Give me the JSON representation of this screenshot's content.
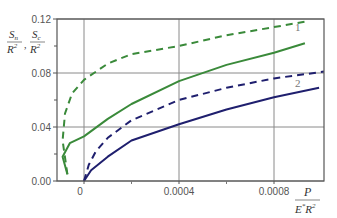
{
  "chart_data": {
    "type": "line",
    "title": "",
    "xlabel": "P / (E* R^2)",
    "ylabel": "S_n / R^2, S_c / R^2",
    "xlim": [
      -0.00012,
      0.00101
    ],
    "ylim": [
      0.0,
      0.12
    ],
    "x_ticks": [
      {
        "value": 0,
        "label": "0"
      },
      {
        "value": 0.0004,
        "label": "0.0004"
      },
      {
        "value": 0.0008,
        "label": "0.0008"
      }
    ],
    "y_ticks": [
      {
        "value": 0.0,
        "label": "0.00"
      },
      {
        "value": 0.04,
        "label": "0.04"
      },
      {
        "value": 0.08,
        "label": "0.08"
      },
      {
        "value": 0.12,
        "label": "0.12"
      }
    ],
    "y_minor_ticks": [
      0.02,
      0.06,
      0.1
    ],
    "x_minor_ticks": [
      0.0002,
      0.0006
    ],
    "grid": true,
    "legend": "none",
    "annotations": [
      {
        "text": "1",
        "x": 0.0009,
        "y": 0.111
      },
      {
        "text": "2",
        "x": 0.0009,
        "y": 0.07
      }
    ],
    "series": [
      {
        "name": "curve 1 (dashed)",
        "group": "1",
        "color": "#3a8a3a",
        "style": "dashed",
        "points": [
          [
            -7e-05,
            0.005
          ],
          [
            -9e-05,
            0.03
          ],
          [
            -8e-05,
            0.05
          ],
          [
            -5e-05,
            0.065
          ],
          [
            0,
            0.075
          ],
          [
            0.0001,
            0.087
          ],
          [
            0.0002,
            0.094
          ],
          [
            0.0004,
            0.1
          ],
          [
            0.0006,
            0.108
          ],
          [
            0.0008,
            0.114
          ],
          [
            0.00093,
            0.118
          ]
        ]
      },
      {
        "name": "curve 1 (solid)",
        "group": "1",
        "color": "#3a8a3a",
        "style": "solid",
        "points": [
          [
            -7e-05,
            0.005
          ],
          [
            -9e-05,
            0.018
          ],
          [
            -6e-05,
            0.028
          ],
          [
            0,
            0.033
          ],
          [
            0.0001,
            0.046
          ],
          [
            0.0002,
            0.057
          ],
          [
            0.0004,
            0.074
          ],
          [
            0.0006,
            0.086
          ],
          [
            0.0008,
            0.095
          ],
          [
            0.00093,
            0.102
          ]
        ]
      },
      {
        "name": "curve 2 (dashed)",
        "group": "2",
        "color": "#1f1f6e",
        "style": "dashed",
        "points": [
          [
            0,
            0
          ],
          [
            2e-05,
            0.012
          ],
          [
            5e-05,
            0.022
          ],
          [
            0.0001,
            0.032
          ],
          [
            0.0002,
            0.045
          ],
          [
            0.0004,
            0.06
          ],
          [
            0.0006,
            0.069
          ],
          [
            0.0008,
            0.076
          ],
          [
            0.00101,
            0.081
          ]
        ]
      },
      {
        "name": "curve 2 (solid)",
        "group": "2",
        "color": "#1f1f6e",
        "style": "solid",
        "points": [
          [
            0,
            0
          ],
          [
            3e-05,
            0.008
          ],
          [
            0.0001,
            0.018
          ],
          [
            0.0002,
            0.03
          ],
          [
            0.0004,
            0.042
          ],
          [
            0.0006,
            0.053
          ],
          [
            0.0008,
            0.062
          ],
          [
            0.00099,
            0.069
          ]
        ]
      }
    ]
  },
  "labels": {
    "y_axis": {
      "num1": "S",
      "sub1": "n",
      "den1": "R",
      "sep": ",",
      "num2": "S",
      "sub2": "c",
      "den2": "R",
      "exp": "2"
    },
    "x_axis": {
      "num": "P",
      "den_e": "E",
      "den_star": "*",
      "den_r": "R",
      "exp": "2"
    }
  }
}
